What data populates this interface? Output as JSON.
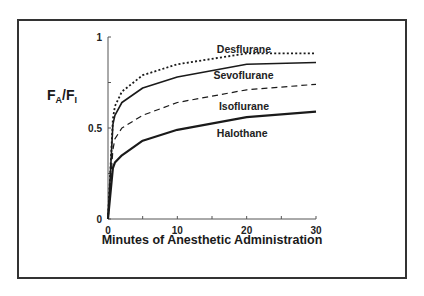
{
  "chart_data": {
    "type": "line",
    "title": "",
    "xlabel": "Minutes of Anesthetic Administration",
    "ylabel": "FA/FI",
    "ylabel_parts": {
      "main_a": "F",
      "sub_a": "A",
      "slash": "/",
      "main_b": "F",
      "sub_b": "I"
    },
    "xlim": [
      0,
      30
    ],
    "ylim": [
      0,
      1
    ],
    "x_ticks": [
      0,
      5,
      10,
      15,
      20,
      25,
      30
    ],
    "x_tick_labels": [
      "0",
      "10",
      "20",
      "30"
    ],
    "x_tick_label_values": [
      0,
      10,
      20,
      30
    ],
    "y_ticks": [
      0,
      0.25,
      0.5,
      0.75,
      1
    ],
    "y_tick_labels": [
      "0",
      "0.5",
      "1"
    ],
    "y_tick_label_values": [
      0,
      0.5,
      1
    ],
    "grid": false,
    "legend": "inline labels",
    "series": [
      {
        "name": "Desflurane",
        "style": "dotted",
        "x": [
          0,
          0.7,
          1,
          2,
          5,
          10,
          20,
          30
        ],
        "values": [
          0,
          0.55,
          0.62,
          0.7,
          0.79,
          0.85,
          0.91,
          0.91
        ],
        "label_pos": {
          "x": 15.7,
          "y": 0.935
        }
      },
      {
        "name": "Sevoflurane",
        "style": "solid",
        "x": [
          0,
          0.7,
          1,
          2,
          5,
          10,
          20,
          30
        ],
        "values": [
          0,
          0.52,
          0.57,
          0.64,
          0.72,
          0.78,
          0.85,
          0.86
        ],
        "label_pos": {
          "x": 15.2,
          "y": 0.79
        }
      },
      {
        "name": "Isoflurane",
        "style": "dashed",
        "x": [
          0,
          0.7,
          1,
          2,
          5,
          10,
          20,
          30
        ],
        "values": [
          0,
          0.38,
          0.44,
          0.5,
          0.57,
          0.64,
          0.71,
          0.74
        ],
        "label_pos": {
          "x": 16.0,
          "y": 0.62
        }
      },
      {
        "name": "Halothane",
        "style": "solid-thick",
        "x": [
          0,
          0.7,
          1,
          2,
          5,
          10,
          20,
          30
        ],
        "values": [
          0,
          0.28,
          0.31,
          0.35,
          0.43,
          0.49,
          0.56,
          0.59
        ],
        "label_pos": {
          "x": 15.7,
          "y": 0.47
        }
      }
    ]
  },
  "colors": {
    "ink": "#1a1a1a",
    "frame": "#333333",
    "background": "#ffffff"
  }
}
